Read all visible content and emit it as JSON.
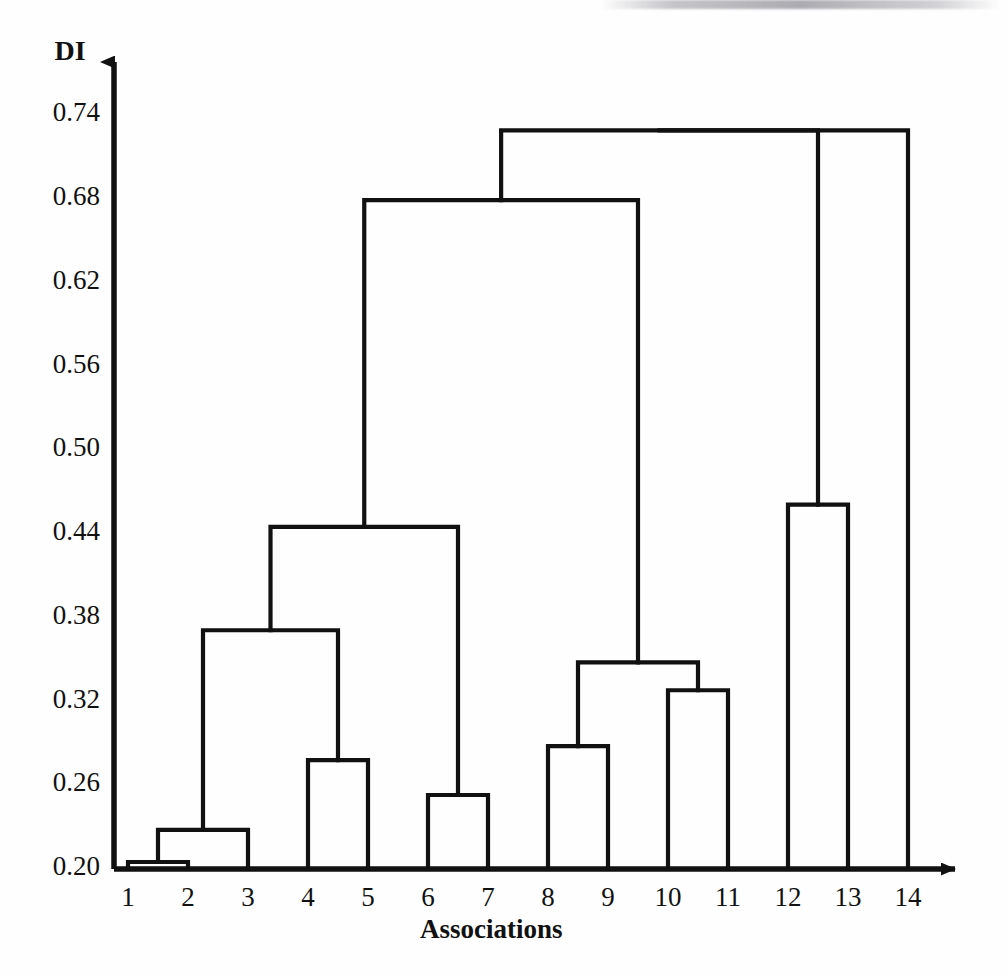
{
  "chart_data": {
    "type": "dendrogram",
    "title": "",
    "xlabel": "Associations",
    "ylabel": "DI",
    "ylim": [
      0.2,
      0.74
    ],
    "grid": false,
    "legend": null,
    "y_ticks": [
      "0.20",
      "0.26",
      "0.32",
      "0.38",
      "0.44",
      "0.50",
      "0.56",
      "0.62",
      "0.68",
      "0.74"
    ],
    "y_tick_values": [
      0.2,
      0.26,
      0.32,
      0.38,
      0.44,
      0.5,
      0.56,
      0.62,
      0.68,
      0.74
    ],
    "leaves": [
      "1",
      "2",
      "3",
      "4",
      "5",
      "6",
      "7",
      "8",
      "9",
      "10",
      "11",
      "12",
      "13",
      "14"
    ],
    "leaf_count": 14,
    "baseline": 0.2,
    "merges": [
      {
        "id": "n1",
        "left": "1",
        "right": "2",
        "height": 0.205
      },
      {
        "id": "n2",
        "left": "n1",
        "right": "3",
        "height": 0.228
      },
      {
        "id": "n3",
        "left": "4",
        "right": "5",
        "height": 0.278
      },
      {
        "id": "n4",
        "left": "n2",
        "right": "n3",
        "height": 0.371
      },
      {
        "id": "n5",
        "left": "6",
        "right": "7",
        "height": 0.253
      },
      {
        "id": "n6",
        "left": "n4",
        "right": "n5",
        "height": 0.445
      },
      {
        "id": "n7",
        "left": "8",
        "right": "9",
        "height": 0.288
      },
      {
        "id": "n8",
        "left": "10",
        "right": "11",
        "height": 0.328
      },
      {
        "id": "n9",
        "left": "n7",
        "right": "n8",
        "height": 0.348
      },
      {
        "id": "n10",
        "left": "n6",
        "right": "n9",
        "height": 0.679
      },
      {
        "id": "n11",
        "left": "12",
        "right": "13",
        "height": 0.461
      },
      {
        "id": "n12",
        "left": "n10",
        "right": "n11",
        "height": 0.729
      },
      {
        "id": "n13",
        "left": "n12",
        "right": "14",
        "height": 0.729
      }
    ],
    "colors": {
      "line": "#111111",
      "background": "#fefefe"
    }
  },
  "axes": {
    "y_axis_label": "DI",
    "x_axis_label": "Associations"
  }
}
